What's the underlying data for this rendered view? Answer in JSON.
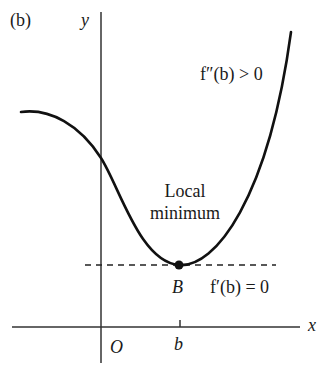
{
  "figure": {
    "panel_label": "(b)",
    "axes": {
      "x_label": "x",
      "y_label": "y",
      "origin_label": "O",
      "tick_label": "b"
    },
    "annotations": {
      "point_label": "B",
      "first_derivative": "f′(b) = 0",
      "second_derivative": "f″(b) > 0",
      "local_min_line1": "Local",
      "local_min_line2": "minimum"
    },
    "colors": {
      "curve": "#111111",
      "axis": "#333333",
      "dashed": "#222222"
    }
  }
}
